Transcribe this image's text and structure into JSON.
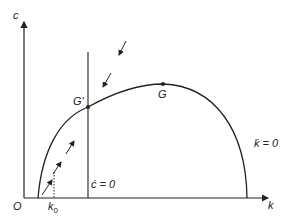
{
  "diagram": {
    "axes": {
      "y_label": "c",
      "x_label": "k",
      "origin_label": "O"
    },
    "points": {
      "g_prime": "G'",
      "g": "G",
      "k0": "k0"
    },
    "loci": {
      "c_dot": "ċ = 0",
      "k_dot": "k̇ = 0"
    },
    "k0_main": "k",
    "k0_sub": "0"
  }
}
